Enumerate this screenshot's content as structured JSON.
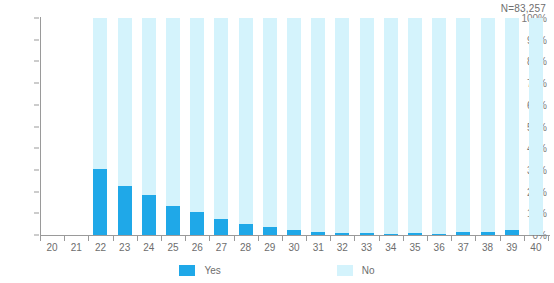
{
  "chart_data": {
    "type": "bar",
    "stacked": true,
    "stacked_to_100": true,
    "title": "",
    "subtitle": "",
    "xlabel": "",
    "ylabel": "",
    "annotation": "N=83,257",
    "grid": false,
    "legend_position": "bottom",
    "ylim": [
      0,
      100
    ],
    "y_ticks": [
      "0%",
      "10%",
      "20%",
      "30%",
      "40%",
      "50%",
      "60%",
      "70%",
      "80%",
      "90%",
      "100%"
    ],
    "y_tick_values": [
      0,
      10,
      20,
      30,
      40,
      50,
      60,
      70,
      80,
      90,
      100
    ],
    "categories": [
      "20",
      "21",
      "22",
      "23",
      "24",
      "25",
      "26",
      "27",
      "28",
      "29",
      "30",
      "31",
      "32",
      "33",
      "34",
      "35",
      "36",
      "37",
      "38",
      "39",
      "40"
    ],
    "series": [
      {
        "name": "Yes",
        "color": "#1fa8e8",
        "values": [
          0,
          0,
          30.5,
          22.6,
          18.5,
          13.2,
          10.4,
          7.5,
          5.0,
          3.6,
          2.3,
          1.3,
          0.9,
          0.9,
          0.6,
          0.7,
          0.5,
          1.3,
          1.5,
          2.3,
          0
        ]
      },
      {
        "name": "No",
        "color": "#d4f3fc",
        "values": [
          0,
          0,
          69.5,
          77.4,
          81.5,
          86.8,
          89.6,
          92.5,
          95.0,
          96.4,
          97.7,
          98.7,
          99.1,
          99.1,
          99.4,
          99.3,
          99.5,
          98.7,
          98.5,
          97.7,
          100
        ]
      }
    ]
  },
  "legend": {
    "items": [
      {
        "label": "Yes",
        "color": "#1fa8e8"
      },
      {
        "label": "No",
        "color": "#d4f3fc"
      }
    ]
  },
  "colors": {
    "yes": "#1fa8e8",
    "no": "#d4f3fc",
    "axis": "#9a9a9a",
    "text": "#6d6d6d"
  }
}
